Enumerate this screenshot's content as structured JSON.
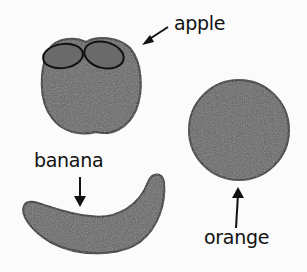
{
  "labels": {
    "apple": "apple",
    "banana": "banana",
    "orange": "orange"
  },
  "colors": {
    "fruit_fill": "#5e5e5e",
    "outline": "#111111",
    "background": "#fbfbfb"
  }
}
